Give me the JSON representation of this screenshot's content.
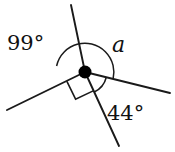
{
  "figure": {
    "kind": "geometry-angle-diagram",
    "width": 175,
    "height": 152,
    "background_color": "#ffffff",
    "stroke_color": "#1a1a1a",
    "text_color": "#111111",
    "vertex": {
      "x": 85,
      "y": 72,
      "radius": 6.5,
      "color": "#000000"
    },
    "labels": {
      "left_angle": "99°",
      "unknown_angle": "a",
      "lower_right_angle": "44°"
    },
    "rays": [
      {
        "name": "upper-ray",
        "from_x": 85,
        "from_y": 72,
        "to_x": 71,
        "to_y": 5
      },
      {
        "name": "lower-steep-ray",
        "from_x": 85,
        "from_y": 72,
        "to_x": 119,
        "to_y": 146
      },
      {
        "name": "left-ray",
        "from_x": 85,
        "from_y": 72,
        "to_x": 7,
        "to_y": 110
      },
      {
        "name": "right-ray",
        "from_x": 85,
        "from_y": 72,
        "to_x": 170,
        "to_y": 93
      }
    ],
    "arcs": [
      {
        "name": "arc-99",
        "label": "99°",
        "radius": 29,
        "start_deg": 168,
        "end_deg": 258
      },
      {
        "name": "arc-a",
        "label": "a",
        "radius": 29,
        "start_deg": 258,
        "end_deg": 346
      },
      {
        "name": "arc-44",
        "label": "44°",
        "radius": 22,
        "start_deg": 14,
        "end_deg": 65
      }
    ],
    "right_angle_marker": {
      "name": "right-angle-marker",
      "size": 19,
      "between": [
        "left-ray",
        "lower-steep-ray"
      ]
    }
  }
}
